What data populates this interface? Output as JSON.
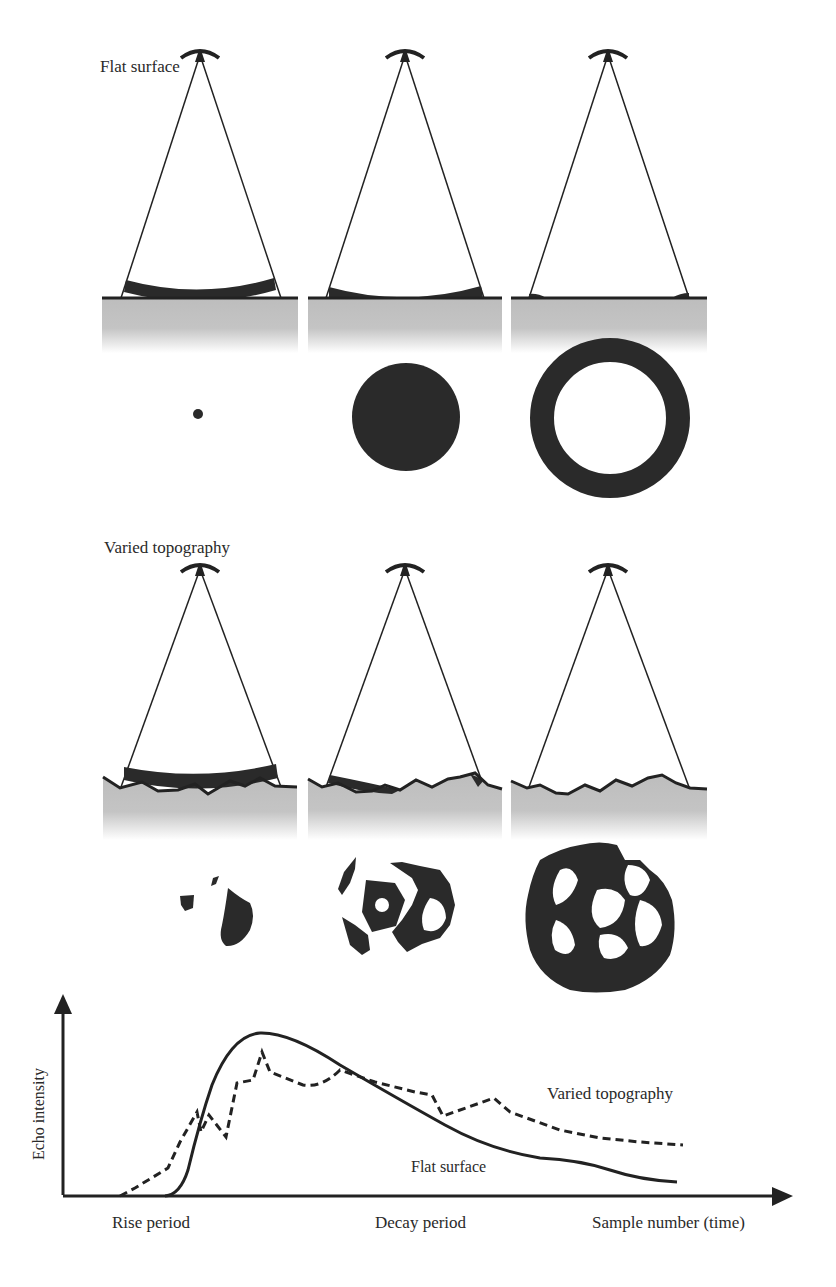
{
  "panels": {
    "flat": {
      "title": "Flat surface",
      "stages": [
        "pulse-at-nadir",
        "pulse-expanding",
        "pulse-at-edges"
      ],
      "footprints": [
        "small-dot",
        "filled-disc",
        "annulus"
      ]
    },
    "varied": {
      "title": "Varied topography",
      "stages": [
        "pulse-at-nadir",
        "pulse-expanding",
        "pulse-at-edges"
      ],
      "footprints": [
        "patchy-small",
        "patchy-medium",
        "patchy-large"
      ]
    }
  },
  "graph": {
    "y_axis_label": "Echo intensity",
    "x_axis_label": "Sample number (time)",
    "rise_label": "Rise period",
    "decay_label": "Decay period",
    "legend": {
      "varied": "Varied topography",
      "flat": "Flat surface"
    }
  }
}
